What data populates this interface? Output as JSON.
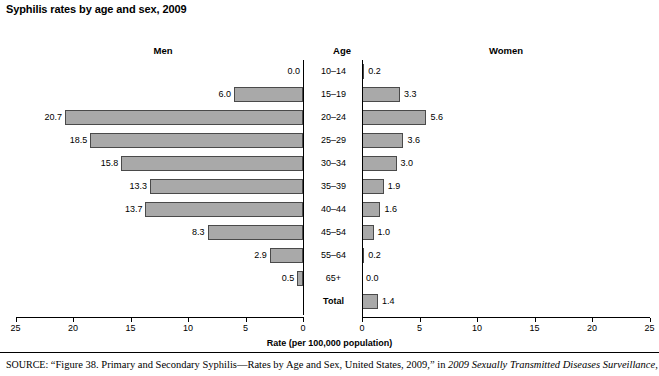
{
  "title": "Syphilis rates by age and sex, 2009",
  "headers": {
    "men": "Men",
    "age": "Age",
    "women": "Women"
  },
  "axis_title": "Rate (per 100,000 population)",
  "source": {
    "lead": "SOURCE:",
    "text_before": " “Figure 38. Primary and Secondary Syphilis—Rates by Age and Sex, United States, 2009,” in ",
    "publication": "2009 Sexually Transmitted Diseases Surveillance",
    "text_after": ","
  },
  "colors": {
    "bar_fill": "#a9a9a9",
    "bar_border": "#4a4a4a",
    "axis": "#000000",
    "text": "#000000"
  },
  "chart_data": {
    "type": "bar",
    "subtype": "population-pyramid",
    "title": "Syphilis rates by age and sex, 2009",
    "xlabel": "Rate (per 100,000 population)",
    "ylabel": "Age",
    "xlim": [
      0,
      25
    ],
    "grid": false,
    "legend_position": "panel-headers",
    "categories": [
      "10–14",
      "15–19",
      "20–24",
      "25–29",
      "30–34",
      "35–39",
      "40–44",
      "45–54",
      "55–64",
      "65+",
      "Total"
    ],
    "series": [
      {
        "name": "Men",
        "side": "left",
        "values": [
          0.0,
          6.0,
          20.7,
          18.5,
          15.8,
          13.3,
          13.7,
          8.3,
          2.9,
          0.5,
          null
        ],
        "labels": [
          "0.0",
          "6.0",
          "20.7",
          "18.5",
          "15.8",
          "13.3",
          "13.7",
          "8.3",
          "2.9",
          "0.5",
          ""
        ]
      },
      {
        "name": "Women",
        "side": "right",
        "values": [
          0.2,
          3.3,
          5.6,
          3.6,
          3.0,
          1.9,
          1.6,
          1.0,
          0.2,
          0.0,
          1.4
        ],
        "labels": [
          "0.2",
          "3.3",
          "5.6",
          "3.6",
          "3.0",
          "1.9",
          "1.6",
          "1.0",
          "0.2",
          "0.0",
          "1.4"
        ]
      }
    ],
    "left_axis_ticks": [
      "25",
      "20",
      "15",
      "10",
      "5",
      "0"
    ],
    "right_axis_ticks": [
      "0",
      "5",
      "10",
      "15",
      "20",
      "25"
    ]
  }
}
